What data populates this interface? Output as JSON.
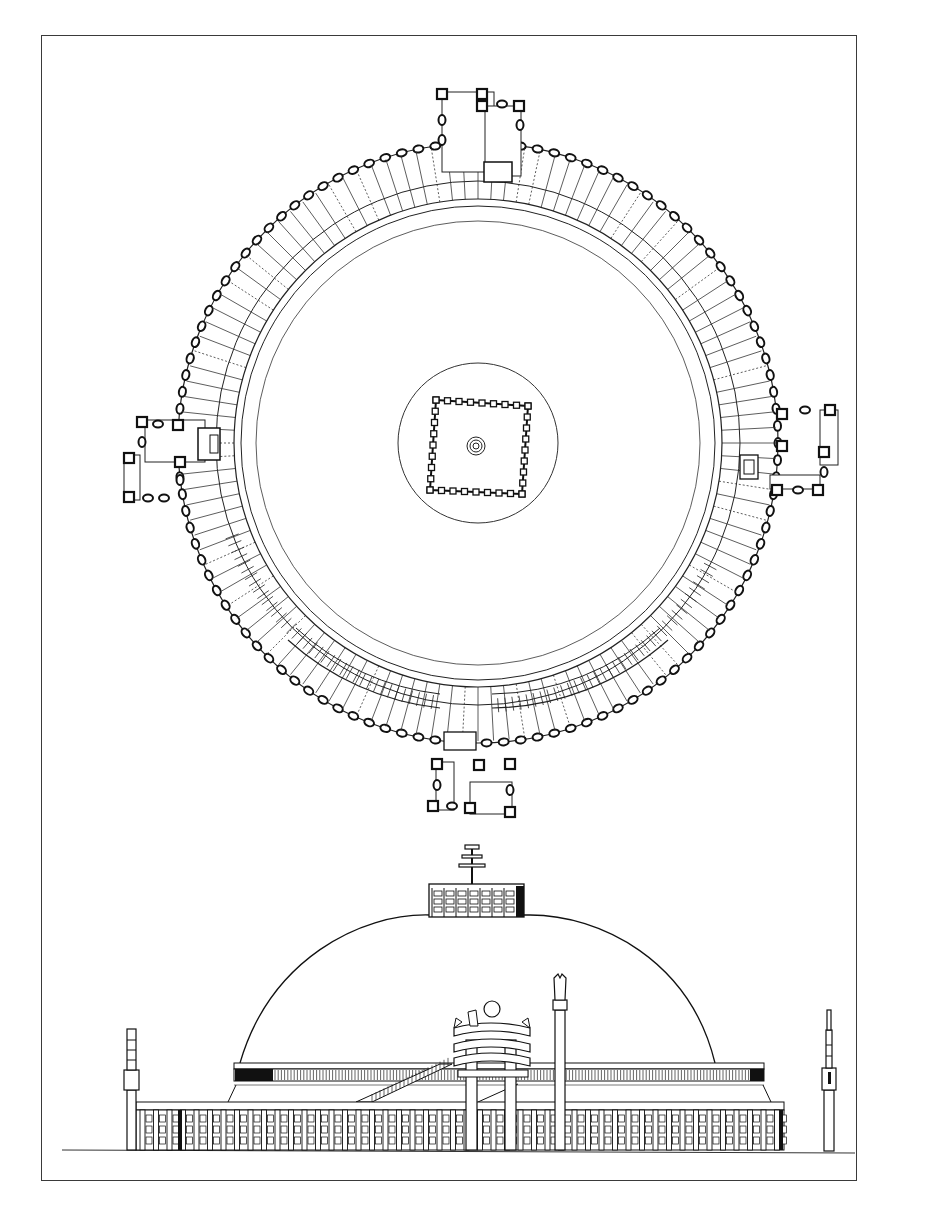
{
  "drawing": {
    "subject": "Stupa plan and elevation",
    "views": [
      {
        "name": "plan",
        "description": "Top-down plan: circular railing with four gateways (N, E, S, W), inner drum circle, square harmika at center"
      },
      {
        "name": "elevation",
        "description": "Side elevation: hemispherical dome, harmika with chattra on top, railing with gateways and pillars at base"
      }
    ],
    "caption": ""
  },
  "colors": {
    "line": "#1a1a1a",
    "frame": "#3a3a3a",
    "background": "#ffffff",
    "fill_dark": "#111111"
  }
}
